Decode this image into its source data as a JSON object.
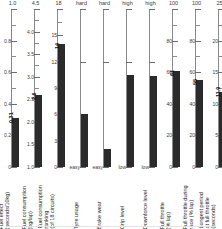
{
  "chart_data": {
    "type": "bar",
    "title": "",
    "subtitle": "",
    "xlabel": "",
    "ylabel": "",
    "grid": false,
    "legend": "none",
    "layout": "nine side-by-side single-bar vertical gauges, each with its own axis scale",
    "categories": [
      "Fuel effect (seconds/10kg)",
      "Fuel consumption (kg/lap)",
      "Fuel consumption ranking (of 18 circuits)",
      "Tyre usage",
      "Brake wear",
      "Grip level",
      "Downforce level",
      "Full throttle (% lap)",
      "Full throttle during race (% lap)",
      "Longest period at full throttle (seconds)"
    ],
    "panels": [
      {
        "caption_lines": [
          "Fuel effect",
          "(seconds/10kg)"
        ],
        "top_label": "1.0",
        "scale_kind": "numeric",
        "min": 0,
        "max": 1.0,
        "ticks": [
          "1.0",
          "0.8",
          "0.6",
          "0.4",
          "0.2",
          "0"
        ],
        "tick_values": [
          1.0,
          0.8,
          0.6,
          0.4,
          0.2,
          0
        ],
        "value": 0.31,
        "value_label": "0.31"
      },
      {
        "caption_lines": [
          "Fuel consumption",
          "(kg/lap)"
        ],
        "top_label": "4.5",
        "scale_kind": "numeric",
        "min": 1.0,
        "max": 4.5,
        "ticks": [
          "4.5",
          "4.0",
          "3.5",
          "3.0",
          "2.5",
          "2.0",
          "1.5",
          "1.0"
        ],
        "tick_values": [
          4.5,
          4.0,
          3.5,
          3.0,
          2.5,
          2.0,
          1.5,
          1.0
        ],
        "value": 2.6,
        "value_label": "2.6"
      },
      {
        "caption_lines": [
          "Fuel consumption",
          "ranking",
          "(of 18 circuits)"
        ],
        "top_label": "18",
        "scale_kind": "numeric",
        "min": 0,
        "max": 18,
        "ticks": [
          "18",
          "15",
          "12",
          "9",
          "6",
          "3",
          "0"
        ],
        "tick_values": [
          18,
          15,
          12,
          9,
          6,
          3,
          0
        ],
        "value": 14,
        "value_label": "14"
      },
      {
        "caption_lines": [
          "Tyre usage"
        ],
        "top_label": "hard",
        "scale_kind": "categorical",
        "min": 0,
        "max": 3,
        "ticks": [
          "",
          "",
          "easy"
        ],
        "tick_values": [
          3,
          2,
          0
        ],
        "value": 1,
        "value_label": ""
      },
      {
        "caption_lines": [
          "Brake wear"
        ],
        "top_label": "hard",
        "scale_kind": "categorical",
        "min": 0,
        "max": 3,
        "ticks": [
          "",
          "",
          "easy"
        ],
        "tick_values": [
          3,
          2,
          0
        ],
        "value": 0.35,
        "value_label": ""
      },
      {
        "caption_lines": [
          "Grip level"
        ],
        "top_label": "high",
        "scale_kind": "categorical",
        "min": 0,
        "max": 3,
        "ticks": [
          "",
          "",
          "low"
        ],
        "tick_values": [
          3,
          2,
          0
        ],
        "value": 1.75,
        "value_label": ""
      },
      {
        "caption_lines": [
          "Downforce level"
        ],
        "top_label": "high",
        "scale_kind": "categorical",
        "min": 0,
        "max": 3,
        "ticks": [
          "",
          "",
          "low"
        ],
        "tick_values": [
          3,
          2,
          0
        ],
        "value": 1.72,
        "value_label": ""
      },
      {
        "caption_lines": [
          "Full throttle",
          "(% lap)"
        ],
        "top_label": "100",
        "scale_kind": "numeric",
        "min": 0,
        "max": 100,
        "ticks": [
          "100",
          "80",
          "60",
          "40",
          "20",
          "0"
        ],
        "tick_values": [
          100,
          80,
          60,
          40,
          20,
          0
        ],
        "value": 61,
        "value_label": "61"
      },
      {
        "caption_lines": [
          "Full throttle during",
          "race (% lap)"
        ],
        "top_label": "100",
        "scale_kind": "numeric",
        "min": 0,
        "max": 100,
        "ticks": [
          "100",
          "80",
          "60",
          "40",
          "20",
          "0"
        ],
        "tick_values": [
          100,
          80,
          60,
          40,
          20,
          0
        ],
        "value": 55,
        "value_label": "55"
      },
      {
        "caption_lines": [
          "Longest period",
          "at full throttle",
          "(seconds)"
        ],
        "top_label": "25",
        "scale_kind": "numeric",
        "min": 0,
        "max": 25,
        "ticks": [
          "25",
          "20",
          "15",
          "10",
          "5",
          "0"
        ],
        "tick_values": [
          25,
          20,
          15,
          10,
          5,
          0
        ],
        "value": 11.9,
        "value_label": "11.9"
      }
    ],
    "colors": {
      "bar": "#2b2b2b",
      "axis": "#8a8a8a",
      "text": "#2a2a2a",
      "background": "#ffffff"
    }
  }
}
